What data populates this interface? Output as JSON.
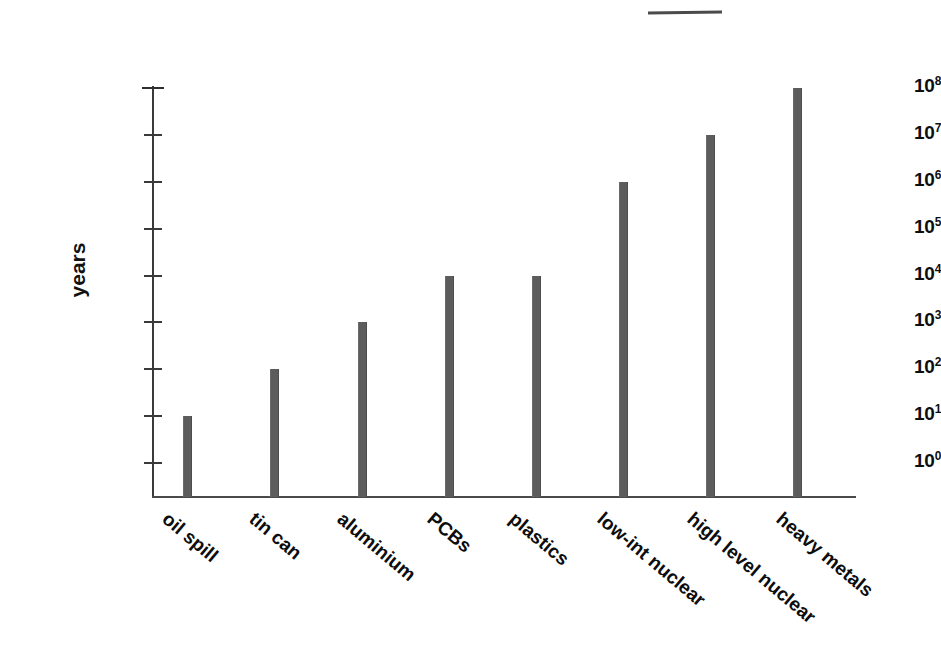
{
  "chart_data": {
    "type": "bar",
    "title": "",
    "xlabel": "",
    "ylabel": "years",
    "yscale": "log",
    "ylim": [
      1,
      100000000
    ],
    "grid": false,
    "legend": null,
    "categories": [
      "oil spill",
      "tin can",
      "aluminium",
      "PCBs",
      "plastics",
      "low-int nuclear",
      "high level nuclear",
      "heavy metals"
    ],
    "values": [
      10,
      100,
      1000,
      10000,
      10000,
      1000000,
      10000000,
      100000000
    ],
    "value_exponents": [
      1,
      2,
      3,
      4,
      4,
      6,
      7,
      8
    ],
    "y_tick_labels": [
      "10⁸",
      "10⁷",
      "10⁶",
      "10⁵",
      "10⁴",
      "10³",
      "10²",
      "10¹",
      "10⁰"
    ],
    "y_tick_mantissa": "10",
    "y_tick_exponents": [
      "8",
      "7",
      "6",
      "5",
      "4",
      "3",
      "2",
      "1",
      "0"
    ],
    "y_tick_values": [
      100000000,
      10000000,
      1000000,
      100000,
      10000,
      1000,
      100,
      10,
      1
    ],
    "bar_color": "#5c5c5c",
    "axis_color": "#3a3a3a",
    "text_color": "#0d0d0d",
    "background": "#ffffff"
  },
  "annotations": {
    "scan_artifact_label": "scan-artifact-mark"
  }
}
